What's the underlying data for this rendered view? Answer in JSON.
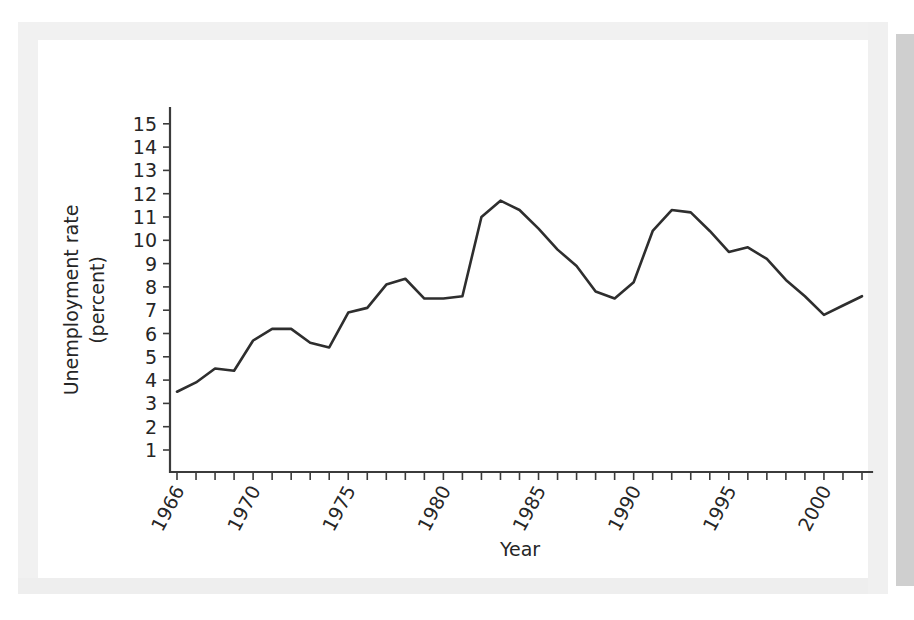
{
  "chart_data": {
    "type": "line",
    "title": "",
    "xlabel": "Year",
    "ylabel": "Unemployment rate (percent)",
    "ylabel_line1": "Unemployment rate",
    "ylabel_line2": "(percent)",
    "xlim": [
      1966,
      2002
    ],
    "ylim": [
      0,
      15.8
    ],
    "grid": false,
    "legend": "none",
    "x_tick_labels": [
      "1966",
      "1970",
      "1975",
      "1980",
      "1985",
      "1990",
      "1995",
      "2000"
    ],
    "x_tick_label_values": [
      1966,
      1970,
      1975,
      1980,
      1985,
      1990,
      1995,
      2000
    ],
    "x_minor_ticks_every": 1,
    "y_tick_labels": [
      "1",
      "2",
      "3",
      "4",
      "5",
      "6",
      "7",
      "8",
      "9",
      "10",
      "11",
      "12",
      "13",
      "14",
      "15"
    ],
    "y_tick_values": [
      1,
      2,
      3,
      4,
      5,
      6,
      7,
      8,
      9,
      10,
      11,
      12,
      13,
      14,
      15
    ],
    "series": [
      {
        "name": "Unemployment rate",
        "color": "#2e2e2e",
        "x": [
          1966,
          1967,
          1968,
          1969,
          1970,
          1971,
          1972,
          1973,
          1974,
          1975,
          1976,
          1977,
          1978,
          1979,
          1980,
          1981,
          1982,
          1983,
          1984,
          1985,
          1986,
          1987,
          1988,
          1989,
          1990,
          1991,
          1992,
          1993,
          1994,
          1995,
          1996,
          1997,
          1998,
          1999,
          2000,
          2001,
          2002
        ],
        "values": [
          3.5,
          3.9,
          4.5,
          4.4,
          5.7,
          6.2,
          6.2,
          5.6,
          5.4,
          6.9,
          7.1,
          8.1,
          8.35,
          7.5,
          7.5,
          7.6,
          11.0,
          11.7,
          11.3,
          10.5,
          9.6,
          8.9,
          7.8,
          7.5,
          8.2,
          10.4,
          11.3,
          11.2,
          10.4,
          9.5,
          9.7,
          9.2,
          8.3,
          7.6,
          6.8,
          7.2,
          7.6
        ]
      }
    ]
  },
  "axis": {
    "x_title": "Year",
    "y_title_line1": "Unemployment rate",
    "y_title_line2": "(percent)"
  }
}
